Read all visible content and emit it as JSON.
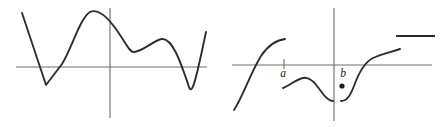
{
  "figure": {
    "background_color": "#ffffff",
    "curve_color": "#2b2b2b",
    "axis_color": "#6e6e6e",
    "label_color": "#1c1c1c"
  },
  "panels": [
    {
      "id": "left-graph",
      "name": "continuous-wavy-curve",
      "axes": {
        "x_axis": {
          "x1": 16,
          "y1": 67,
          "x2": 207,
          "y2": 67
        },
        "y_axis": {
          "x1": 110,
          "y1": 8,
          "x2": 110,
          "y2": 118
        }
      },
      "labels": [],
      "curves": [
        {
          "name": "wavy-curve",
          "path": "M 22 13 L 46 85 L 62 64 C 72 48 80 18 90 12 C 100 7 112 22 122 38 C 128 47 130 52 134 52 C 142 52 154 40 162 39 C 172 38 180 60 189 87 C 192 96 196 80 206 32"
        }
      ],
      "dots": [],
      "segments": []
    },
    {
      "id": "right-graph",
      "name": "piecewise-discontinuous-function",
      "axes": {
        "x_axis": {
          "x1": 9,
          "y1": 65,
          "x2": 209,
          "y2": 65
        },
        "y_axis": {
          "x1": 111,
          "y1": 8,
          "x2": 111,
          "y2": 121
        }
      },
      "labels": [
        {
          "name": "label-a",
          "text": "a",
          "x": 60,
          "y": 77,
          "tick": {
            "x": 61,
            "y1": 59,
            "y2": 69
          }
        },
        {
          "name": "label-b",
          "text": "b",
          "x": 120,
          "y": 77,
          "tick": null
        }
      ],
      "curves": [
        {
          "name": "left-branch-increasing",
          "path": "M 11 110 C 20 96 28 72 38 56 C 46 44 54 40 62 39"
        },
        {
          "name": "middle-branch-hump",
          "path": "M 60 88 C 66 86 72 80 80 78 C 88 76 94 86 100 94 C 104 99 107 101 110 101"
        },
        {
          "name": "right-branch-rising",
          "path": "M 118 101 C 124 101 127 96 131 86 C 136 72 142 62 150 58 C 158 54 168 52 177 49"
        }
      ],
      "dots": [
        {
          "name": "isolated-point",
          "x": 119,
          "y": 86,
          "r": 2.6
        }
      ],
      "segments": [
        {
          "name": "horizontal-segment-top-right",
          "x1": 173,
          "y1": 36,
          "x2": 212,
          "y2": 36
        }
      ]
    }
  ],
  "chart_data": {
    "type": "line",
    "xlabel": "",
    "ylabel": "",
    "grid": false,
    "legend": null,
    "subplots": [
      {
        "name": "left-graph",
        "description": "A single continuous wavy curve crossing the x-axis four times, with a sharp V-shaped minimum on the left, a rounded maximum left of the y-axis, a shallow local minimum and local maximum to the right, then a deep rounded minimum before rising steeply at the right edge.",
        "series": [
          {
            "name": "wavy-curve",
            "type": "line",
            "points": [
              {
                "x": 22,
                "y": 13
              },
              {
                "x": 46,
                "y": 85
              },
              {
                "x": 62,
                "y": 64
              },
              {
                "x": 89,
                "y": 12
              },
              {
                "x": 110,
                "y": 26
              },
              {
                "x": 134,
                "y": 52
              },
              {
                "x": 162,
                "y": 39
              },
              {
                "x": 190,
                "y": 88
              },
              {
                "x": 206,
                "y": 32
              }
            ],
            "feature_labels": [
              "sharp-minimum",
              "x-axis-crossing",
              "global-maximum",
              "local-minimum",
              "local-maximum",
              "deep-minimum",
              "steep-rise"
            ]
          }
        ],
        "annotations": []
      },
      {
        "name": "right-graph",
        "description": "A piecewise function with three disconnected branches, a labeled point a on the x-axis with a tick mark, a labeled point b at the y-axis, an isolated filled dot below the axis near b, and a free-floating horizontal segment at the upper right.",
        "series": [
          {
            "name": "left-branch-increasing",
            "type": "line",
            "points": [
              {
                "x": 11,
                "y": 110
              },
              {
                "x": 38,
                "y": 56
              },
              {
                "x": 62,
                "y": 39
              }
            ]
          },
          {
            "name": "middle-branch-hump",
            "type": "line",
            "points": [
              {
                "x": 60,
                "y": 88
              },
              {
                "x": 82,
                "y": 78
              },
              {
                "x": 100,
                "y": 94
              },
              {
                "x": 110,
                "y": 101
              }
            ]
          },
          {
            "name": "right-branch-rising",
            "type": "line",
            "points": [
              {
                "x": 118,
                "y": 101
              },
              {
                "x": 131,
                "y": 86
              },
              {
                "x": 150,
                "y": 58
              },
              {
                "x": 177,
                "y": 49
              }
            ]
          },
          {
            "name": "horizontal-segment-top-right",
            "type": "line",
            "points": [
              {
                "x": 173,
                "y": 36
              },
              {
                "x": 212,
                "y": 36
              }
            ]
          }
        ],
        "annotations": [
          {
            "name": "label-a",
            "text": "a",
            "x": 61,
            "y": 65,
            "position": "below-axis",
            "has_tick": true
          },
          {
            "name": "label-b",
            "text": "b",
            "x": 121,
            "y": 65,
            "position": "below-axis",
            "has_tick": false
          },
          {
            "name": "isolated-point",
            "text": "",
            "x": 119,
            "y": 86,
            "marker": "filled-dot"
          }
        ]
      }
    ]
  }
}
